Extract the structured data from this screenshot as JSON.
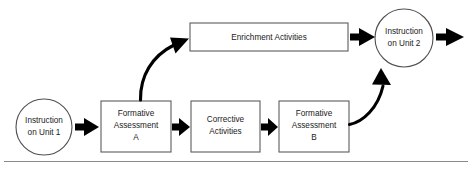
{
  "diagram": {
    "background_color": "#ffffff",
    "box_border_color": "#5c5c5c",
    "circle_border_color": "#4f4f4f",
    "arrow_color": "#000000",
    "text_color": "#1a1a1a",
    "rule_color": "#8a8a8a",
    "nodes": [
      {
        "id": "instruction-unit-1",
        "shape": "circle",
        "lines": [
          "Instruction",
          "on Unit 1"
        ],
        "line1": "Instruction",
        "line2": "on Unit 1",
        "cx": 44,
        "cy": 127,
        "r": 28
      },
      {
        "id": "formative-assessment-a",
        "shape": "rect",
        "lines": [
          "Formative",
          "Assessment",
          "A"
        ],
        "line1": "Formative",
        "line2": "Assessment",
        "line3": "A",
        "x": 101,
        "y": 101,
        "w": 70,
        "h": 51
      },
      {
        "id": "corrective-activities",
        "shape": "rect",
        "lines": [
          "Corrective",
          "Activities"
        ],
        "line1": "Corrective",
        "line2": "Activities",
        "x": 191,
        "y": 101,
        "w": 69,
        "h": 51
      },
      {
        "id": "formative-assessment-b",
        "shape": "rect",
        "lines": [
          "Formative",
          "Assessment",
          "B"
        ],
        "line1": "Formative",
        "line2": "Assessment",
        "line3": "B",
        "x": 279,
        "y": 101,
        "w": 70,
        "h": 51
      },
      {
        "id": "enrichment-activities",
        "shape": "rect",
        "lines": [
          "Enrichment Activities"
        ],
        "line1": "Enrichment Activities",
        "x": 190,
        "y": 23,
        "w": 158,
        "h": 28
      },
      {
        "id": "instruction-unit-2",
        "shape": "circle",
        "lines": [
          "Instruction",
          "on Unit 2"
        ],
        "line1": "Instruction",
        "line2": "on Unit 2",
        "cx": 404,
        "cy": 38,
        "r": 29
      }
    ],
    "connectors": [
      {
        "id": "unit1-to-fa-a",
        "type": "straight-arrow",
        "from": "instruction-unit-1",
        "to": "formative-assessment-a"
      },
      {
        "id": "fa-a-to-corrective",
        "type": "straight-arrow",
        "from": "formative-assessment-a",
        "to": "corrective-activities"
      },
      {
        "id": "corrective-to-fa-b",
        "type": "straight-arrow",
        "from": "corrective-activities",
        "to": "formative-assessment-b"
      },
      {
        "id": "fa-a-to-enrichment",
        "type": "curved-arrow",
        "from": "formative-assessment-a",
        "to": "enrichment-activities"
      },
      {
        "id": "enrichment-to-unit2",
        "type": "straight-arrow",
        "from": "enrichment-activities",
        "to": "instruction-unit-2"
      },
      {
        "id": "fa-b-to-unit2",
        "type": "curved-arrow",
        "from": "formative-assessment-b",
        "to": "instruction-unit-2"
      },
      {
        "id": "unit2-exit",
        "type": "straight-arrow",
        "from": "instruction-unit-2",
        "to": ""
      }
    ],
    "divider": {
      "id": "bottom-rule",
      "y": 161,
      "x1": 4,
      "x2": 468
    }
  }
}
